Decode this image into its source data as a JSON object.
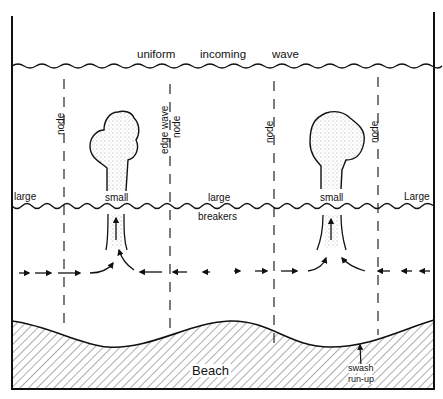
{
  "diagram": {
    "title_wave": "uniform incoming wave",
    "title_words": [
      "uniform",
      "incoming",
      "wave"
    ],
    "node_labels": [
      "node",
      "node",
      "node",
      "node"
    ],
    "edge_wave_label": "edge wave",
    "breaker_labels": {
      "left_large": "large",
      "small_1": "small",
      "mid_large": "large",
      "small_2": "small",
      "right_large": "Large"
    },
    "breakers_label": "breakers",
    "beach_label": "Beach",
    "swash_label_line1": "swash",
    "swash_label_line2": "run-up",
    "colors": {
      "ink": "#111111",
      "background": "#ffffff"
    }
  }
}
